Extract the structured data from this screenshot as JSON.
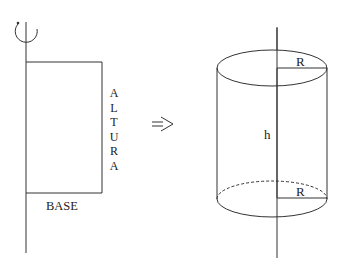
{
  "left_figure": {
    "height_label_letters": [
      "A",
      "L",
      "T",
      "U",
      "R",
      "A"
    ],
    "base_label": "BASE",
    "rotation_icon": "rotation-arrow-icon"
  },
  "transform_arrow": "=>",
  "right_figure": {
    "radius_top_label": "R",
    "radius_bottom_label": "R",
    "height_label": "h"
  },
  "colors": {
    "stroke": "#333333",
    "background": "#ffffff"
  }
}
